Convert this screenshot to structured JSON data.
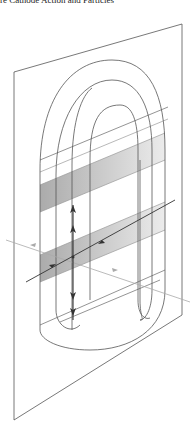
{
  "caption": "re Cathode Action and Particles",
  "diagram": {
    "colors": {
      "line": "#555555",
      "band": "#bfbfbf",
      "band_dark": "#9a9a9a",
      "arrow": "#333333",
      "light_line": "#aaaaaa"
    },
    "elements": [
      "plane",
      "outer-loop",
      "middle-loop",
      "inner-loop",
      "upper-band",
      "lower-band",
      "vertical-double-arrow",
      "diagonal-arrow-line",
      "horizontal-light-arrow"
    ]
  }
}
